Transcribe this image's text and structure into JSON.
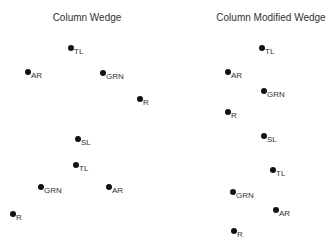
{
  "panels": [
    {
      "title": "Column Wedge",
      "title_x": 87,
      "points": [
        {
          "label": "TL",
          "x": 71,
          "y": 48
        },
        {
          "label": "AR",
          "x": 28,
          "y": 72
        },
        {
          "label": "GRN",
          "x": 103,
          "y": 73
        },
        {
          "label": "R",
          "x": 140,
          "y": 99
        },
        {
          "label": "SL",
          "x": 78,
          "y": 139
        },
        {
          "label": "TL",
          "x": 76,
          "y": 165
        },
        {
          "label": "GRN",
          "x": 41,
          "y": 187
        },
        {
          "label": "AR",
          "x": 109,
          "y": 187
        },
        {
          "label": "R",
          "x": 13,
          "y": 214
        }
      ]
    },
    {
      "title": "Column Modified Wedge",
      "title_x": 271,
      "points": [
        {
          "label": "TL",
          "x": 262,
          "y": 48
        },
        {
          "label": "AR",
          "x": 228,
          "y": 72
        },
        {
          "label": "GRN",
          "x": 264,
          "y": 91
        },
        {
          "label": "R",
          "x": 228,
          "y": 112
        },
        {
          "label": "SL",
          "x": 264,
          "y": 136
        },
        {
          "label": "TL",
          "x": 273,
          "y": 170
        },
        {
          "label": "GRN",
          "x": 233,
          "y": 192
        },
        {
          "label": "AR",
          "x": 276,
          "y": 210
        },
        {
          "label": "R",
          "x": 234,
          "y": 231
        }
      ]
    }
  ]
}
